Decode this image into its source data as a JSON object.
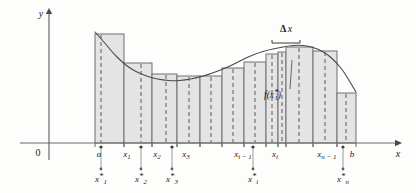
{
  "figure": {
    "axes": {
      "y_label": "y",
      "x_label": "x",
      "origin_label": "0"
    },
    "annotations": {
      "delta_x": "Δx",
      "delta_x_symbol": "Δ",
      "delta_x_var": "x",
      "function_value": "f(x",
      "function_value_sub": "i",
      "function_value_star": "*",
      "function_value_close": ")"
    },
    "partition_labels": [
      {
        "id": "a",
        "base": "a",
        "sub": "",
        "x": 99
      },
      {
        "id": "x1",
        "base": "x",
        "sub": "1",
        "x": 127
      },
      {
        "id": "x2",
        "base": "x",
        "sub": "2",
        "x": 157
      },
      {
        "id": "x3",
        "base": "x",
        "sub": "3",
        "x": 186
      },
      {
        "id": "xi-1",
        "base": "x",
        "sub": "i − 1",
        "x": 243
      },
      {
        "id": "xi",
        "base": "x",
        "sub": "i",
        "x": 275
      },
      {
        "id": "xn-1",
        "base": "x",
        "sub": "n − 1",
        "x": 327
      },
      {
        "id": "b",
        "base": "b",
        "sub": "",
        "x": 352
      }
    ],
    "sample_point_labels": [
      {
        "id": "x1star",
        "base": "x",
        "sub": "1",
        "star": "*",
        "x": 101,
        "tick_x": 101
      },
      {
        "id": "x2star",
        "base": "x",
        "sub": "2",
        "star": "*",
        "x": 141,
        "tick_x": 141
      },
      {
        "id": "x3star",
        "base": "x",
        "sub": "3",
        "star": "*",
        "x": 172,
        "tick_x": 172
      },
      {
        "id": "xistar",
        "base": "x",
        "sub": "i",
        "star": "*",
        "x": 253,
        "tick_x": 253
      },
      {
        "id": "xnstar",
        "base": "x",
        "sub": "n",
        "star": "*",
        "x": 343,
        "tick_x": 343
      }
    ],
    "colors": {
      "bar_fill": "#e4e4e4",
      "bar_stroke": "#6f6f6f",
      "curve": "#4a4a4a",
      "axis": "#6a6a6a",
      "dashed": "#7a7a7a",
      "text": "#1a1a1a",
      "background": "#fdfdfc"
    }
  },
  "chart_data": {
    "type": "bar",
    "xlabel": "x",
    "ylabel": "y",
    "grid": false,
    "legend": null,
    "baseline_y_px": 143,
    "axis": {
      "x_axis_y_px": 143,
      "y_axis_x_px": 49,
      "x_axis_start_px": 20,
      "x_axis_end_px": 395,
      "y_axis_top_px": 14
    },
    "interval": {
      "a_px": 95,
      "b_px": 356
    },
    "bars": [
      {
        "index": 1,
        "x0": 95,
        "x1": 124,
        "top": 34,
        "sample_px": 101
      },
      {
        "index": 2,
        "x0": 124,
        "x1": 152,
        "top": 63,
        "sample_px": 141
      },
      {
        "index": 3,
        "x0": 152,
        "x1": 177,
        "top": 74,
        "sample_px": 166
      },
      {
        "index": 4,
        "x0": 177,
        "x1": 200,
        "top": 76,
        "sample_px": 189
      },
      {
        "index": 5,
        "x0": 200,
        "x1": 222,
        "top": 76,
        "sample_px": 211
      },
      {
        "index": 6,
        "x0": 222,
        "x1": 244,
        "top": 68,
        "sample_px": 233
      },
      {
        "index": 7,
        "x0": 244,
        "x1": 266,
        "top": 62,
        "sample_px": 255
      },
      {
        "index": 8,
        "x0": 266,
        "x1": 278,
        "top": 54,
        "sample_px": 272
      },
      {
        "index": 9,
        "x0": 278,
        "x1": 286,
        "top": 52,
        "sample_px": 282
      },
      {
        "index": 10,
        "x0": 286,
        "x1": 313,
        "top": 47,
        "sample_px": 299
      },
      {
        "index": 11,
        "x0": 313,
        "x1": 337,
        "top": 51,
        "sample_px": 325
      },
      {
        "index": 12,
        "x0": 337,
        "x1": 356,
        "top": 93,
        "sample_px": 346
      }
    ],
    "curve_points_px": [
      [
        95,
        32
      ],
      [
        104,
        42
      ],
      [
        113,
        53
      ],
      [
        122,
        62
      ],
      [
        131,
        69
      ],
      [
        141,
        74
      ],
      [
        152,
        78
      ],
      [
        163,
        80
      ],
      [
        174,
        81
      ],
      [
        185,
        80
      ],
      [
        196,
        78
      ],
      [
        207,
        75
      ],
      [
        218,
        71
      ],
      [
        228,
        67
      ],
      [
        238,
        62
      ],
      [
        248,
        57
      ],
      [
        258,
        53
      ],
      [
        268,
        50
      ],
      [
        278,
        48
      ],
      [
        288,
        46
      ],
      [
        298,
        45
      ],
      [
        308,
        46
      ],
      [
        318,
        49
      ],
      [
        327,
        54
      ],
      [
        336,
        62
      ],
      [
        344,
        72
      ],
      [
        350,
        82
      ],
      [
        356,
        92
      ]
    ],
    "delta_x_bracket_px": {
      "x0": 272,
      "x1": 300,
      "y": 43,
      "label_y": 32
    },
    "function_label_px": {
      "x": 264,
      "y": 98,
      "leader_to": [
        292,
        60
      ]
    }
  }
}
